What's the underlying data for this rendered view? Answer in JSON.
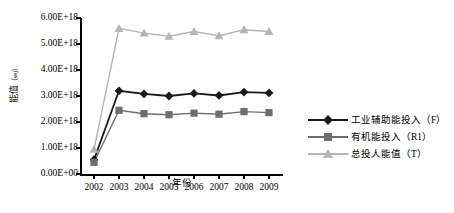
{
  "chart_data": {
    "type": "line",
    "title": "",
    "xlabel": "年份",
    "ylabel": "能值（sej）",
    "ylabel_text": "能值",
    "ylabel_unit": "（sej）",
    "categories": [
      "2002",
      "2003",
      "2004",
      "2005",
      "2006",
      "2007",
      "2008",
      "2009"
    ],
    "ylim": [
      0,
      6e+18
    ],
    "ytick_labels": [
      "6.00E+18",
      "5.00E+18",
      "4.00E+18",
      "3.00E+18",
      "2.00E+18",
      "1.00E+18",
      "0.00E+00"
    ],
    "ytick_values": [
      6e+18,
      5e+18,
      4e+18,
      3e+18,
      2e+18,
      1e+18,
      0
    ],
    "grid": false,
    "legend_position": "right",
    "series": [
      {
        "name": "工业辅助能投入（F）",
        "marker": "diamond",
        "color": "#1a1a1a",
        "values": [
          5.5e+17,
          3.2e+18,
          3.08e+18,
          3e+18,
          3.1e+18,
          3.02e+18,
          3.15e+18,
          3.12e+18
        ]
      },
      {
        "name": "有机能投入（R1）",
        "marker": "square",
        "color": "#6e6e6e",
        "values": [
          4.5e+17,
          2.45e+18,
          2.32e+18,
          2.28e+18,
          2.34e+18,
          2.3e+18,
          2.4e+18,
          2.36e+18
        ]
      },
      {
        "name": "总投入能值（T）",
        "marker": "triangle",
        "color": "#b5b5b5",
        "values": [
          9.5e+17,
          5.6e+18,
          5.42e+18,
          5.3e+18,
          5.48e+18,
          5.32e+18,
          5.55e+18,
          5.48e+18
        ]
      }
    ]
  },
  "legend": {
    "items": [
      {
        "label": "工业辅助能投入（F）"
      },
      {
        "label": "有机能投入（R1）"
      },
      {
        "label": "总投人能值（T）"
      }
    ]
  }
}
